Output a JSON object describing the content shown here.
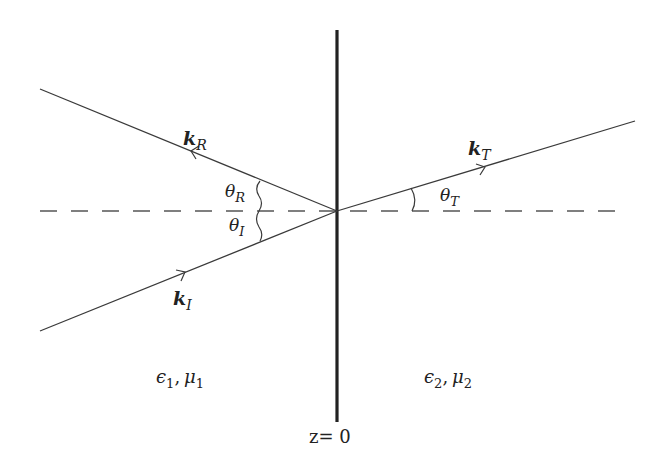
{
  "diagram": {
    "interface_label": "z= 0",
    "rays": {
      "incident": {
        "label": "k",
        "subscript": "I",
        "angle_label": "θ",
        "angle_subscript": "I"
      },
      "reflected": {
        "label": "k",
        "subscript": "R",
        "angle_label": "θ",
        "angle_subscript": "R"
      },
      "transmitted": {
        "label": "k",
        "subscript": "T",
        "angle_label": "θ",
        "angle_subscript": "T"
      }
    },
    "media": {
      "left": {
        "eps": "ϵ",
        "eps_sub": "1",
        "mu": "μ",
        "mu_sub": "1",
        "sep": ","
      },
      "right": {
        "eps": "ϵ",
        "eps_sub": "2",
        "mu": "μ",
        "mu_sub": "2",
        "sep": ","
      }
    },
    "colors": {
      "line": "#3a3a3a",
      "interface": "#222222",
      "dash": "#555555"
    }
  }
}
